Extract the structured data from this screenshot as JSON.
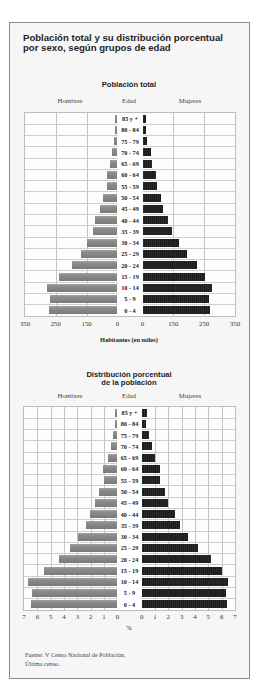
{
  "title": {
    "line1": "Población total y su distribución porcentual",
    "line2": "por sexo, según grupos de edad"
  },
  "chart1": {
    "title": "Población total",
    "headers": {
      "left": "Hombres",
      "center": "Edad",
      "right": "Mujeres"
    },
    "ticks_left": [
      "350",
      "250",
      "150",
      "0"
    ],
    "ticks_right": [
      "0",
      "150",
      "250",
      "350"
    ],
    "xlabel": "Habitantes (en miles)"
  },
  "chart2": {
    "title_line1": "Distribución porcentual",
    "title_line2": "de la población",
    "headers": {
      "left": "Hombres",
      "center": "Edad",
      "right": "Mujeres"
    },
    "ticks_left": [
      "7",
      "6",
      "5",
      "4",
      "3",
      "2",
      "1",
      "0"
    ],
    "ticks_right": [
      "0",
      "1",
      "2",
      "3",
      "4",
      "5",
      "6",
      "7"
    ],
    "xlabel": "%"
  },
  "footer": {
    "source": "Fuente: V Censo Nacional de Población.",
    "note": "Último censo."
  },
  "colors": {
    "hombres": "#7f7f7f",
    "mujeres": "#1f1f1f",
    "grid": "#c4c4c4",
    "frame": "#8a8a8a"
  },
  "chart_data": [
    {
      "type": "bar",
      "orientation": "horizontal",
      "subtype": "population-pyramid",
      "title": "Población total",
      "categories": [
        "85 y +",
        "80 - 84",
        "75 - 79",
        "70 - 74",
        "65 - 69",
        "60 - 64",
        "55 - 59",
        "50 - 54",
        "45 - 49",
        "40 - 44",
        "35 - 39",
        "30 - 34",
        "25 - 29",
        "20 - 24",
        "15 - 19",
        "10 - 14",
        "5 - 9",
        "0 - 4"
      ],
      "series": [
        {
          "name": "Hombres",
          "side": "left",
          "values": [
            10,
            12,
            19,
            29,
            36,
            53,
            52,
            72,
            85,
            109,
            121,
            150,
            169,
            197,
            240,
            280,
            270,
            273
          ]
        },
        {
          "name": "Mujeres",
          "side": "right",
          "values": [
            16,
            15,
            24,
            39,
            48,
            66,
            70,
            90,
            100,
            124,
            144,
            168,
            195,
            227,
            253,
            275,
            265,
            270
          ]
        }
      ],
      "xlabel": "Habitantes (en miles)",
      "ylabel": "Edad",
      "xticks": [
        0,
        150,
        250,
        350
      ],
      "xlim": [
        0,
        350
      ],
      "grid": true,
      "legend": "column headers (Hombres / Mujeres)"
    },
    {
      "type": "bar",
      "orientation": "horizontal",
      "subtype": "population-pyramid",
      "title": "Distribución porcentual de la población",
      "categories": [
        "85 y +",
        "80 - 84",
        "75 - 79",
        "70 - 74",
        "65 - 69",
        "60 - 64",
        "55 - 59",
        "50 - 54",
        "45 - 49",
        "40 - 44",
        "35 - 39",
        "30 - 34",
        "25 - 29",
        "20 - 24",
        "15 - 19",
        "10 - 14",
        "5 - 9",
        "0 - 4"
      ],
      "series": [
        {
          "name": "Hombres",
          "side": "left",
          "values": [
            0.15,
            0.2,
            0.33,
            0.5,
            0.7,
            1.05,
            1.0,
            1.4,
            1.65,
            2.05,
            2.35,
            2.95,
            3.55,
            4.35,
            5.5,
            6.7,
            6.4,
            6.45
          ]
        },
        {
          "name": "Mujeres",
          "side": "right",
          "values": [
            0.37,
            0.35,
            0.58,
            0.78,
            0.98,
            1.38,
            1.4,
            1.78,
            1.98,
            2.48,
            2.88,
            3.49,
            4.2,
            5.2,
            6.0,
            6.5,
            6.35,
            6.4
          ]
        }
      ],
      "xlabel": "%",
      "ylabel": "Edad",
      "xticks": [
        0,
        1,
        2,
        3,
        4,
        5,
        6,
        7
      ],
      "xlim": [
        0,
        7
      ],
      "grid": true,
      "legend": "column headers (Hombres / Mujeres)"
    }
  ]
}
